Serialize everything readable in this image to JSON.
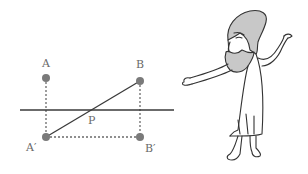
{
  "diagram": {
    "points": {
      "A": {
        "label": "A",
        "x": 46,
        "y": 78
      },
      "B": {
        "label": "B",
        "x": 140,
        "y": 81
      },
      "A_prime": {
        "label": "A′",
        "x": 46,
        "y": 137
      },
      "B_prime": {
        "label": "B′",
        "x": 140,
        "y": 137
      },
      "P": {
        "label": "P",
        "x": 91,
        "y": 110
      }
    },
    "mirror_line": {
      "x1": 20,
      "x2": 174,
      "y": 110
    },
    "colors": {
      "point": "#7a7a7a",
      "line": "#3a3a3a",
      "dashed": "#6a6a6a",
      "label": "#6a6a6a",
      "beard": "#c8c8c8",
      "hair": "#c8c8c8"
    },
    "character": "bearded-philosopher"
  }
}
